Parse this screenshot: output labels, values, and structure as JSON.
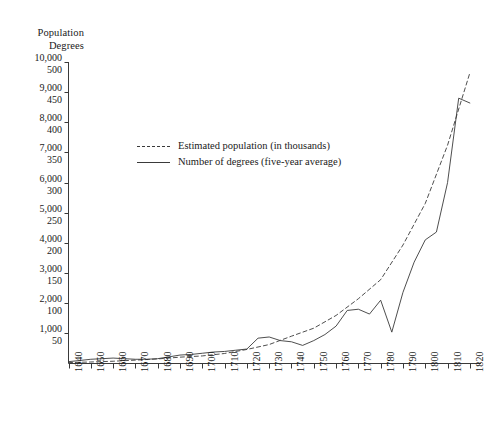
{
  "chart_data": {
    "type": "line",
    "title": "",
    "subtitle": "",
    "xlabel": "",
    "ylabel": "Population",
    "ylabel_secondary": "Degrees",
    "grid": false,
    "legend_position": "inside-upper-left",
    "xlim": [
      1640,
      1825
    ],
    "ylim_population": [
      0,
      10000
    ],
    "ylim_degrees": [
      0,
      500
    ],
    "x_tick_labels": [
      "1640",
      "1650",
      "1660",
      "1670",
      "1680",
      "1690",
      "1700",
      "1710",
      "1720",
      "1730",
      "1740",
      "1750",
      "1760",
      "1770",
      "1780",
      "1790",
      "1800",
      "1810",
      "1820"
    ],
    "y_tick_labels_population": [
      "10,000",
      "9,000",
      "8,000",
      "7,000",
      "6,000",
      "5,000",
      "4,000",
      "3,000",
      "2,000",
      "1,000"
    ],
    "y_tick_labels_degrees": [
      "500",
      "450",
      "400",
      "350",
      "300",
      "250",
      "200",
      "150",
      "100",
      "50"
    ],
    "y_tick_values_population": [
      10000,
      9000,
      8000,
      7000,
      6000,
      5000,
      4000,
      3000,
      2000,
      1000
    ],
    "y_tick_values_degrees": [
      500,
      450,
      400,
      350,
      300,
      250,
      200,
      150,
      100,
      50
    ],
    "series": [
      {
        "name": "Estimated population (in thousands)",
        "style": "dashed",
        "color": "#3a3a3a",
        "axis": "population",
        "units": "thousands",
        "x": [
          1640,
          1650,
          1660,
          1670,
          1680,
          1690,
          1700,
          1710,
          1720,
          1730,
          1740,
          1750,
          1760,
          1770,
          1780,
          1790,
          1800,
          1810,
          1820
        ],
        "values": [
          30,
          50,
          75,
          112,
          152,
          210,
          251,
          332,
          466,
          629,
          906,
          1171,
          1594,
          2148,
          2780,
          3929,
          5308,
          7240,
          9638
        ]
      },
      {
        "name": "Number of degrees (five-year average)",
        "style": "solid",
        "color": "#3a3a3a",
        "axis": "degrees",
        "units": "degrees",
        "x": [
          1640,
          1645,
          1650,
          1655,
          1660,
          1665,
          1670,
          1675,
          1680,
          1685,
          1690,
          1695,
          1700,
          1705,
          1710,
          1715,
          1720,
          1725,
          1730,
          1735,
          1740,
          1745,
          1750,
          1755,
          1760,
          1765,
          1770,
          1775,
          1780,
          1785,
          1790,
          1795,
          1800,
          1805,
          1810,
          1815,
          1820
        ],
        "values": [
          3,
          5,
          7,
          8,
          9,
          8,
          7,
          7,
          8,
          11,
          14,
          15,
          17,
          19,
          20,
          22,
          24,
          42,
          44,
          38,
          36,
          30,
          38,
          48,
          62,
          88,
          90,
          82,
          105,
          52,
          118,
          168,
          205,
          218,
          300,
          440,
          432
        ]
      }
    ],
    "annotations": []
  },
  "headings": {
    "population": "Population",
    "degrees": "Degrees"
  },
  "legend": {
    "items": [
      {
        "label": "Estimated population (in thousands)",
        "style": "dashed"
      },
      {
        "label": "Number of degrees (five-year average)",
        "style": "solid"
      }
    ]
  },
  "colors": {
    "ink": "#3a3a3a",
    "text": "#1a1a1a",
    "background": "#ffffff"
  }
}
